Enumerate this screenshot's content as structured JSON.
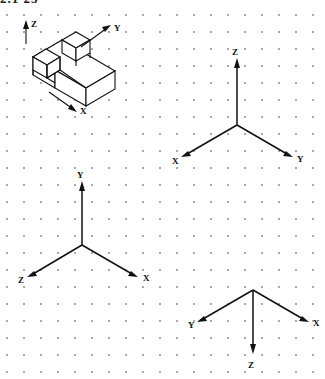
{
  "page": {
    "title_fragment": "2.1  23",
    "background_color": "#ffffff",
    "ink_color": "#111111",
    "grid": {
      "type": "dot-grid",
      "dot_color": "#9a9a9a",
      "spacing_px": 17
    }
  },
  "figures": [
    {
      "id": "isometric-object",
      "name": "isometric-pictorial-block",
      "description": "Isometric drawing of a stepped block with two raised cubes",
      "axis_labels": {
        "x": "X",
        "y": "Y",
        "z": "Z"
      },
      "axis_directions": {
        "x": "lower-right",
        "y": "upper-right",
        "z": "up"
      }
    },
    {
      "id": "axes-top-right",
      "name": "axis-triad-z-up",
      "labels": {
        "up": "Z",
        "lower_left": "X",
        "lower_right": "Y"
      },
      "origin": {
        "x": 237,
        "y": 125
      }
    },
    {
      "id": "axes-middle-left",
      "name": "axis-triad-y-up",
      "labels": {
        "up": "Y",
        "lower_left": "Z",
        "lower_right": "X"
      },
      "origin": {
        "x": 82,
        "y": 245
      }
    },
    {
      "id": "axes-bottom-right",
      "name": "axis-triad-z-down",
      "labels": {
        "down": "Z",
        "upper_left": "Y",
        "upper_right": "X"
      },
      "origin": {
        "x": 253,
        "y": 290
      }
    }
  ],
  "labels": {
    "x": "X",
    "y": "Y",
    "z": "Z"
  }
}
